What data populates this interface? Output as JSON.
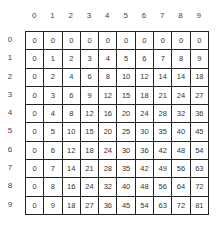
{
  "table": {
    "col_headers": [
      "0",
      "1",
      "2",
      "3",
      "4",
      "5",
      "6",
      "7",
      "8",
      "9"
    ],
    "row_headers": [
      "0",
      "1",
      "2",
      "3",
      "4",
      "5",
      "6",
      "7",
      "8",
      "9"
    ],
    "rows": [
      [
        "0",
        "0",
        "0",
        "0",
        "0",
        "0",
        "0",
        "0",
        "0",
        "0"
      ],
      [
        "0",
        "1",
        "2",
        "3",
        "4",
        "5",
        "6",
        "7",
        "8",
        "9"
      ],
      [
        "0",
        "2",
        "4",
        "6",
        "8",
        "10",
        "12",
        "14",
        "14",
        "18"
      ],
      [
        "0",
        "3",
        "6",
        "9",
        "12",
        "15",
        "18",
        "21",
        "24",
        "27"
      ],
      [
        "0",
        "4",
        "8",
        "12",
        "16",
        "20",
        "24",
        "28",
        "32",
        "36"
      ],
      [
        "0",
        "5",
        "10",
        "15",
        "20",
        "25",
        "30",
        "35",
        "40",
        "45"
      ],
      [
        "0",
        "6",
        "12",
        "18",
        "24",
        "30",
        "36",
        "42",
        "48",
        "54"
      ],
      [
        "0",
        "7",
        "14",
        "21",
        "28",
        "35",
        "42",
        "49",
        "56",
        "63"
      ],
      [
        "0",
        "8",
        "16",
        "24",
        "32",
        "40",
        "48",
        "56",
        "64",
        "72"
      ],
      [
        "0",
        "9",
        "18",
        "27",
        "36",
        "45",
        "54",
        "63",
        "72",
        "81"
      ]
    ]
  }
}
